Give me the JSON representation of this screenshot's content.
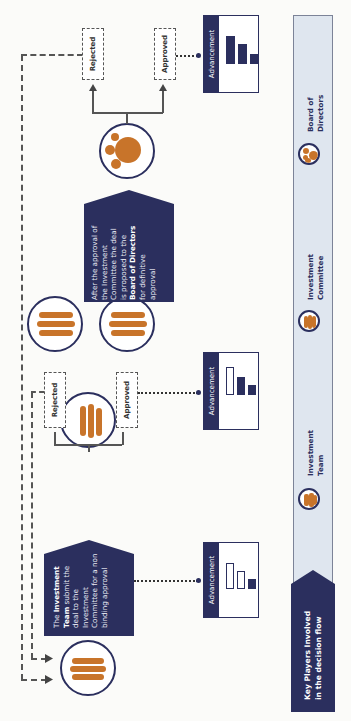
{
  "orientation": "rotated 90 degrees counter-clockwise",
  "colors": {
    "navy": "#2b2f5e",
    "orange": "#c8742a",
    "legend_bg": "#dfe6ef",
    "line": "#555555"
  },
  "legend": {
    "title_line1": "Key Players Involved",
    "title_line2": "in the decision flow",
    "items": [
      {
        "icon": "investment-team-icon",
        "line1": "Investment",
        "line2": "Team"
      },
      {
        "icon": "investment-committee-icon",
        "line1": "Investment",
        "line2": "Committee"
      },
      {
        "icon": "board-of-directors-icon",
        "line1": "Board of",
        "line2": "Directors"
      }
    ]
  },
  "steps": {
    "step1": {
      "note_parts": [
        "The ",
        "Investment",
        "Team",
        " submit the",
        "deal to the",
        "Investment",
        "Committee for a non",
        "binding approval"
      ],
      "advancement_label": "Advancement",
      "bars": [
        "outline",
        "outline",
        "filled"
      ]
    },
    "step2": {
      "rejected": "Rejected",
      "approved": "Approved",
      "advancement_label": "Advancement",
      "bars": [
        "outline",
        "filled",
        "filled"
      ]
    },
    "step3": {
      "note_parts": [
        "After the approval of",
        "the Investment",
        "Committee the deal",
        "is proposed to the",
        "Board of Directors",
        "for definitive",
        "approval"
      ],
      "rejected": "Rejected",
      "approved": "Approved",
      "advancement_label": "Advancement",
      "bars": [
        "filled",
        "filled",
        "filled"
      ]
    }
  }
}
